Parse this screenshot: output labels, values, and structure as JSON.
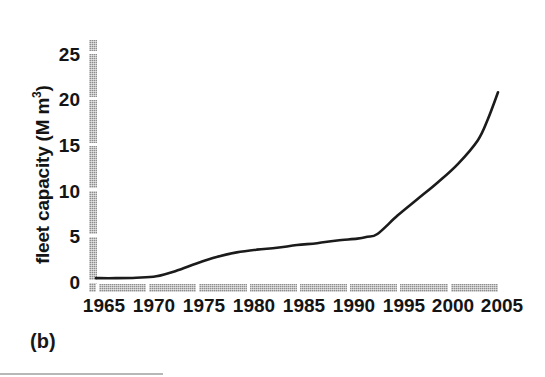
{
  "caption": "(b)",
  "axis": {
    "y_title_main": "fleet capacity (M m",
    "y_title_sup": "3",
    "y_title_tail": ")",
    "y_ticks": [
      "0",
      "5",
      "10",
      "15",
      "20",
      "25"
    ],
    "x_ticks": [
      "1965",
      "1970",
      "1975",
      "1980",
      "1985",
      "1990",
      "1995",
      "2000",
      "2005"
    ]
  },
  "colors": {
    "line": "#1b1b1b",
    "axis": "#8e8e8e",
    "text": "#141414",
    "background": "#ffffff"
  },
  "chart_data": {
    "type": "line",
    "title": "",
    "subtitle": "",
    "xlabel": "",
    "ylabel": "fleet capacity (M m3)",
    "xlim": [
      1965,
      2005
    ],
    "ylim": [
      0,
      26
    ],
    "grid": false,
    "legend": null,
    "annotations": [
      "(b)"
    ],
    "x_tick_values": [
      1965,
      1970,
      1975,
      1980,
      1985,
      1990,
      1995,
      2000,
      2005
    ],
    "y_tick_values": [
      0,
      5,
      10,
      15,
      20,
      25
    ],
    "series": [
      {
        "name": "fleet capacity",
        "x": [
          1965,
          1967,
          1969,
          1971,
          1973,
          1975,
          1977,
          1979,
          1981,
          1983,
          1985,
          1987,
          1989,
          1991,
          1992,
          1993,
          1995,
          1997,
          1999,
          2001,
          2003,
          2004,
          2005
        ],
        "values": [
          0.2,
          0.2,
          0.25,
          0.4,
          1.0,
          1.8,
          2.5,
          3.0,
          3.3,
          3.5,
          3.8,
          4.0,
          4.3,
          4.5,
          4.7,
          5.0,
          7.0,
          8.8,
          10.6,
          12.6,
          15.2,
          17.5,
          20.4
        ]
      }
    ]
  }
}
